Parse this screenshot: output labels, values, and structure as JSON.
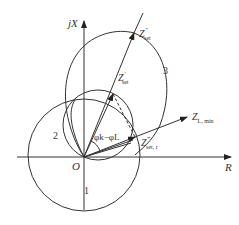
{
  "diagram": {
    "type": "impedance-plane characteristic diagram",
    "axes": {
      "x_label": "R",
      "y_label": "jX",
      "origin_label": "O"
    },
    "curves": [
      {
        "id": "1",
        "label": "1",
        "description": "circle below/around origin"
      },
      {
        "id": "2",
        "label": "2",
        "description": "circle through origin, diameter to Z'set"
      },
      {
        "id": "3",
        "label": "3",
        "description": "lens-shaped characteristic through O and Z''set"
      }
    ],
    "vectors": [
      {
        "id": "zset2",
        "label_main": "Z",
        "label_sup": "″",
        "label_sub": "set"
      },
      {
        "id": "zset1",
        "label_main": "Z",
        "label_sup": "′",
        "label_sub": "set"
      },
      {
        "id": "zsetr",
        "label_main": "Z",
        "label_sup": "‴",
        "label_sub": "set, r"
      },
      {
        "id": "zlmin",
        "label_main": "Z",
        "label_sub": "L, min"
      }
    ],
    "angle_label": "φk−φL",
    "colors": {
      "stroke": "#333333",
      "background": "#ffffff"
    }
  }
}
